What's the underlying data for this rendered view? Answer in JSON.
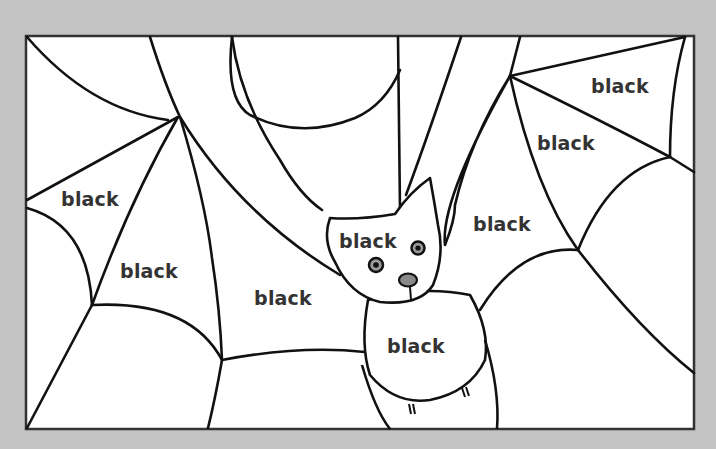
{
  "page": {
    "background_color": "#c3c3c3",
    "frame_fill": "#ffffff",
    "line_color": "#111111",
    "label_color": "#333333",
    "nose_color": "#8a8a8a"
  },
  "worksheet": {
    "subject": "bat on a spider web coloring page",
    "regions": [
      {
        "id": "web-left-upper",
        "label": "black",
        "x": 90,
        "y": 199
      },
      {
        "id": "web-left-middle",
        "label": "black",
        "x": 149,
        "y": 271
      },
      {
        "id": "web-center-bottom",
        "label": "black",
        "x": 283,
        "y": 298
      },
      {
        "id": "bat-head",
        "label": "black",
        "x": 368,
        "y": 241
      },
      {
        "id": "bat-body",
        "label": "black",
        "x": 416,
        "y": 346
      },
      {
        "id": "web-center-right",
        "label": "black",
        "x": 502,
        "y": 224
      },
      {
        "id": "web-right-middle",
        "label": "black",
        "x": 566,
        "y": 143
      },
      {
        "id": "web-right-top",
        "label": "black",
        "x": 620,
        "y": 86
      }
    ]
  }
}
